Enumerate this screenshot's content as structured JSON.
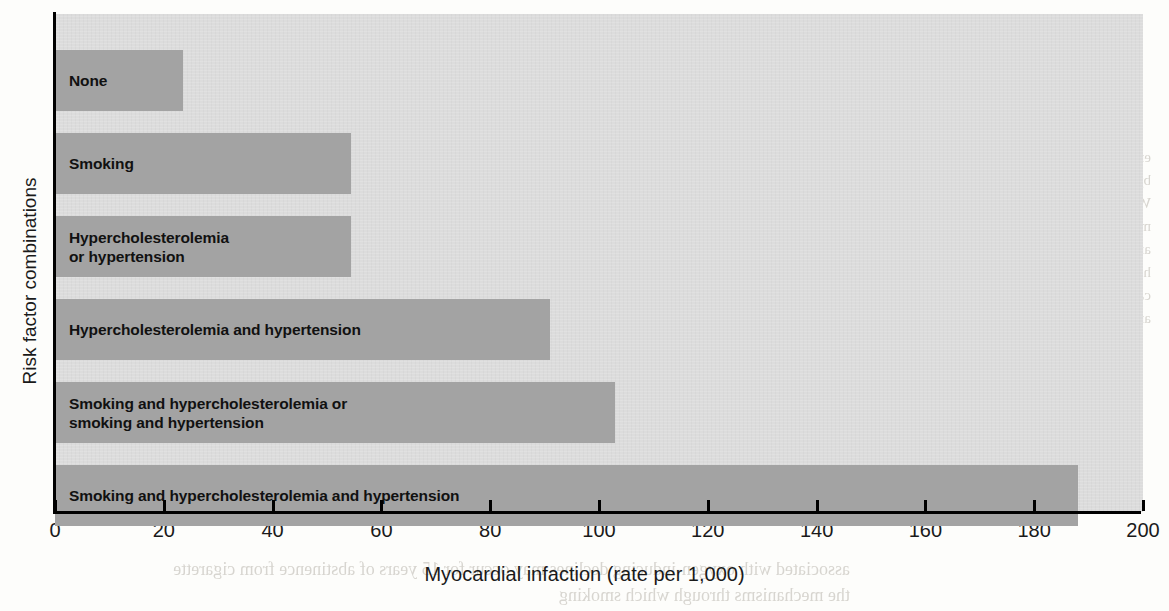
{
  "chart_data": {
    "type": "bar",
    "orientation": "horizontal",
    "title": "",
    "xlabel": "Myocardial infaction (rate per 1,000)",
    "ylabel": "Risk factor combinations",
    "xlim": [
      0,
      200
    ],
    "xticks": [
      0,
      20,
      40,
      60,
      80,
      100,
      120,
      140,
      160,
      180,
      200
    ],
    "xticklabels": [
      "0",
      "20",
      "40",
      "60",
      "80",
      "100",
      "120",
      "140",
      "160",
      "180",
      "200"
    ],
    "grid": false,
    "legend": null,
    "categories": [
      "None",
      "Smoking",
      "Hypercholesterolemia\nor hypertension",
      "Hypercholesterolemia and hypertension",
      "Smoking and hypercholesterolemia or\nsmoking and hypertension",
      "Smoking and hypercholesterolemia and hypertension"
    ],
    "values": [
      23.5,
      54.5,
      54.5,
      91,
      103,
      188
    ],
    "bar_color": "#a3a3a3",
    "plot_background": "#dcdcdc",
    "label_color": "#111111",
    "axis_color": "#000000"
  },
  "bleed_text": {
    "right_top": "ential pathophysiology directly or the diseases caused by\nto harmful external agents and deficiencies of\n. With the deleterious properties of the LDL that\nd cells may mediate tissue damage and recognition\nof these are the traumatic contaminants, occu-\nhypertension has developed. In this chapter we con-\nand disease caused by (1) exposure to toxic agents,\nnal damage and (2) nutritional deficiencies.",
    "left_mid": "proportional to the\nng, community ac-\ncumulative present\nat the age of symp-\nstandard.",
    "bottom_left": "associated with oxygen-inducing declines may occur\nfor 15 years of abstinence from cigarette\nthe mechanisms through which smoking"
  }
}
